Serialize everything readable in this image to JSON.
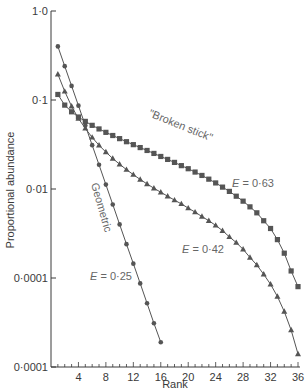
{
  "chart_data": {
    "type": "line",
    "title": "",
    "xlabel": "Rank",
    "ylabel": "Proportional abundance",
    "yscale": "log",
    "xlim": [
      0,
      36
    ],
    "ylim": [
      0.0001,
      1.0
    ],
    "x_ticks": [
      4,
      8,
      12,
      16,
      20,
      24,
      28,
      32,
      36
    ],
    "x_tick_labels": [
      "4",
      "8",
      "12",
      "16",
      "20",
      "24",
      "28",
      "32",
      "36"
    ],
    "y_ticks": [
      1.0,
      0.1,
      0.01,
      0.001,
      0.0001
    ],
    "y_tick_labels": [
      "1·0",
      "0·1",
      "0·01",
      "0·0001",
      "0·0001"
    ],
    "grid": false,
    "legend": null,
    "series": [
      {
        "name": "\"Broken stick\"",
        "marker": "square",
        "evenness_label": "E = 0·63",
        "x": [
          1,
          2,
          3,
          4,
          5,
          6,
          7,
          8,
          9,
          10,
          11,
          12,
          13,
          14,
          15,
          16,
          17,
          18,
          19,
          20,
          21,
          22,
          23,
          24,
          25,
          26,
          27,
          28,
          29,
          30,
          31,
          32,
          33,
          34,
          35,
          36
        ],
        "values": [
          0.1154,
          0.0876,
          0.0737,
          0.0644,
          0.0575,
          0.0519,
          0.0473,
          0.0433,
          0.0399,
          0.0368,
          0.034,
          0.0315,
          0.0292,
          0.0271,
          0.0251,
          0.0232,
          0.0215,
          0.0199,
          0.0183,
          0.0169,
          0.0155,
          0.0142,
          0.0129,
          0.0117,
          0.0105,
          0.0094,
          0.0083,
          0.0073,
          0.0063,
          0.0054,
          0.0044,
          0.0036,
          0.0027,
          0.0019,
          0.0012,
          0.0008
        ]
      },
      {
        "name": "E = 0·42",
        "marker": "triangle",
        "evenness_label": "E = 0·42",
        "x": [
          1,
          2,
          3,
          4,
          5,
          6,
          7,
          8,
          9,
          10,
          11,
          12,
          13,
          14,
          15,
          16,
          17,
          18,
          19,
          20,
          21,
          22,
          23,
          24,
          25,
          26,
          27,
          28,
          29,
          30,
          31,
          32,
          33,
          34,
          35,
          36
        ],
        "values": [
          0.195,
          0.125,
          0.085,
          0.062,
          0.048,
          0.038,
          0.031,
          0.026,
          0.022,
          0.019,
          0.0165,
          0.0145,
          0.0128,
          0.0114,
          0.0102,
          0.0092,
          0.0083,
          0.0075,
          0.0068,
          0.0061,
          0.0055,
          0.0049,
          0.0044,
          0.0039,
          0.0034,
          0.0029,
          0.0025,
          0.0021,
          0.0017,
          0.0014,
          0.0011,
          0.00085,
          0.00062,
          0.00042,
          0.00026,
          0.00014
        ]
      },
      {
        "name": "Geometric",
        "marker": "circle",
        "evenness_label": "E = 0·25",
        "x": [
          1,
          2,
          3,
          4,
          5,
          6,
          7,
          8,
          9,
          10,
          11,
          12,
          13,
          14,
          15,
          16
        ],
        "values": [
          0.4,
          0.24,
          0.144,
          0.0864,
          0.0518,
          0.0311,
          0.0187,
          0.0112,
          0.0067,
          0.004,
          0.0024,
          0.00145,
          0.00087,
          0.00052,
          0.00031,
          0.00019
        ]
      }
    ],
    "annotations": [
      {
        "text": "\"Broken stick\"",
        "near": "square series, ranks 14-20"
      },
      {
        "text": "E = 0·63",
        "near": "square series, rank ~27"
      },
      {
        "text": "Geometric",
        "near": "circle series, rank ~8, rotated"
      },
      {
        "text": "E = 0·42",
        "near": "triangle series, rank ~22"
      },
      {
        "text": "E = 0·25",
        "near": "circle series end, rank ~10"
      }
    ]
  },
  "labels": {
    "xlabel": "Rank",
    "ylabel": "Proportional abundance",
    "broken_stick": "\"Broken stick\"",
    "geometric": "Geometric",
    "e063_prefix": "E",
    "e063_suffix": " = 0·63",
    "e042_prefix": "E",
    "e042_suffix": " = 0·42",
    "e025_prefix": "E",
    "e025_suffix": " = 0·25"
  },
  "colors": {
    "ink": "#3a3a3a",
    "annotation": "#666666",
    "background": "#ffffff"
  }
}
